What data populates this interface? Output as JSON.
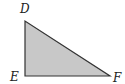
{
  "diagram": {
    "type": "right-triangle",
    "vertices": [
      {
        "label": "D",
        "x": 25,
        "y": 21
      },
      {
        "label": "E",
        "x": 25,
        "y": 76
      },
      {
        "label": "F",
        "x": 110,
        "y": 76
      }
    ],
    "right_angle_at": "E",
    "fill_color": "#c8c8c8",
    "stroke_color": "#333333"
  }
}
